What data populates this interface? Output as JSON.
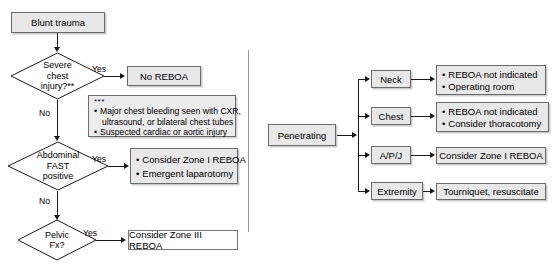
{
  "diagram": {
    "divider_label": "vertical-divider"
  },
  "blunt": {
    "start": "Blunt trauma",
    "decision_1": "Severe\nchest\ninjury?**",
    "decision_1_yes": "Yes",
    "decision_1_no": "No",
    "outcome_1": "No REBOA",
    "note_marker": "***",
    "note_lines": [
      "Major chest bleeding seen with CXR,",
      "ultrasound, or bilateral chest tubes",
      "Suspected cardiac or aortic injury"
    ],
    "decision_2": "Abdominal\nFAST\npositive",
    "decision_2_yes": "Yes",
    "decision_2_no": "No",
    "outcome_2": [
      "Consider Zone I REBOA",
      "Emergent laparotomy"
    ],
    "decision_3": "Pelvic\nFx?",
    "decision_3_yes": "Yes",
    "outcome_3": "Consider Zone III REBOA"
  },
  "penetrating": {
    "start": "Penetrating",
    "branches": [
      {
        "label": "Neck",
        "outcome": [
          "REBOA not indicated",
          "Operating room"
        ]
      },
      {
        "label": "Chest",
        "outcome": [
          "REBOA not indicated",
          "Consider thoracotomy"
        ]
      },
      {
        "label": "A/P/J",
        "outcome": [
          "Consider Zone I REBOA"
        ]
      },
      {
        "label": "Extremity",
        "outcome": [
          "Tourniquet, resuscitate"
        ]
      }
    ]
  },
  "colors": {
    "node_fill": "#e8e8e8",
    "node_border": "#6b6b6b",
    "line": "#1a1a1a",
    "divider": "#9a9a9a",
    "background": "#ffffff"
  }
}
